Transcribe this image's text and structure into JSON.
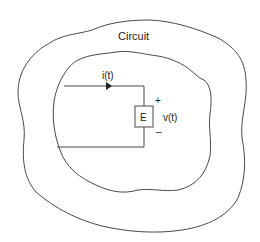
{
  "diagram": {
    "title": "Circuit",
    "current_label": "i(t)",
    "voltage_label": "v(t)",
    "source_label": "E",
    "plus_sign": "+",
    "minus_sign": "–",
    "colors": {
      "stroke": "#4a4a4a",
      "text": "#222222",
      "background": "#ffffff"
    }
  }
}
